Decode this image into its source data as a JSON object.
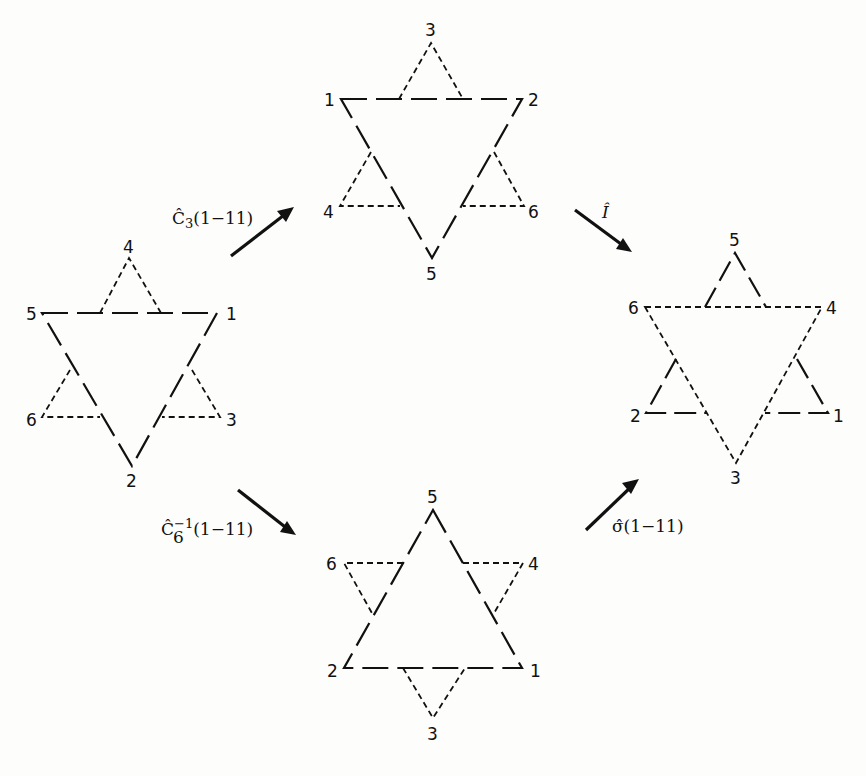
{
  "diagram": {
    "type": "symmetry-operation-equivalence",
    "stars": [
      {
        "id": "start",
        "position": "left",
        "large_triangle": {
          "style": "solid",
          "vertices": [
            "5",
            "1",
            "2"
          ]
        },
        "small_triangles": [
          {
            "style": "dashed",
            "apex": "4"
          },
          {
            "style": "dashed",
            "apex": "6"
          },
          {
            "style": "dashed",
            "apex": "3"
          }
        ],
        "labels": {
          "top": "4",
          "upper_left": "5",
          "upper_right": "1",
          "lower_left": "6",
          "lower_right": "3",
          "bottom": "2"
        }
      },
      {
        "id": "after-c3",
        "position": "top",
        "large_triangle": {
          "style": "solid",
          "vertices": [
            "1",
            "2",
            "5"
          ]
        },
        "small_triangles": [
          {
            "style": "dashed",
            "apex": "3"
          },
          {
            "style": "dashed",
            "apex": "4"
          },
          {
            "style": "dashed",
            "apex": "6"
          }
        ],
        "labels": {
          "top": "3",
          "upper_left": "1",
          "upper_right": "2",
          "lower_left": "4",
          "lower_right": "6",
          "bottom": "5"
        }
      },
      {
        "id": "after-c6inv",
        "position": "bottom",
        "large_triangle": {
          "style": "solid",
          "vertices": [
            "5",
            "2",
            "1"
          ]
        },
        "small_triangles": [
          {
            "style": "dashed",
            "apex": "6"
          },
          {
            "style": "dashed",
            "apex": "4"
          },
          {
            "style": "dashed",
            "apex": "3"
          }
        ],
        "labels": {
          "top": "5",
          "upper_left": "6",
          "upper_right": "4",
          "lower_left": "2",
          "lower_right": "1",
          "bottom": "3"
        }
      },
      {
        "id": "result",
        "position": "right",
        "large_triangle": {
          "style": "dashed",
          "vertices": [
            "6",
            "4",
            "3"
          ]
        },
        "small_triangles": [
          {
            "style": "solid",
            "apex": "5"
          },
          {
            "style": "solid",
            "apex": "2"
          },
          {
            "style": "solid",
            "apex": "1"
          }
        ],
        "labels": {
          "top": "5",
          "upper_left": "6",
          "upper_right": "4",
          "lower_left": "2",
          "lower_right": "1",
          "bottom": "3"
        }
      }
    ],
    "operations": [
      {
        "id": "c3",
        "from": "start",
        "to": "after-c3",
        "label_main": "Ĉ",
        "label_sub": "3",
        "label_sup": "",
        "label_arg": "(1−11)"
      },
      {
        "id": "inversion",
        "from": "after-c3",
        "to": "result",
        "label_main": "Î",
        "label_sub": "",
        "label_sup": "",
        "label_arg": ""
      },
      {
        "id": "c6inv",
        "from": "start",
        "to": "after-c6inv",
        "label_main": "Ĉ",
        "label_sub": "6",
        "label_sup": "−1",
        "label_arg": "(1−11)"
      },
      {
        "id": "sigma",
        "from": "after-c6inv",
        "to": "result",
        "label_main": "σ̂",
        "label_sub": "",
        "label_sup": "",
        "label_arg": "(1−11)"
      }
    ]
  },
  "labels": {
    "left": {
      "n4": "4",
      "n5": "5",
      "n1": "1",
      "n6": "6",
      "n3": "3",
      "n2": "2"
    },
    "top": {
      "n3": "3",
      "n1": "1",
      "n2": "2",
      "n4": "4",
      "n6": "6",
      "n5": "5"
    },
    "bottom": {
      "n5": "5",
      "n6": "6",
      "n4": "4",
      "n2": "2",
      "n1": "1",
      "n3": "3"
    },
    "right": {
      "n5": "5",
      "n6": "6",
      "n4": "4",
      "n2": "2",
      "n1": "1",
      "n3": "3"
    }
  },
  "ops": {
    "c3": {
      "main": "Ĉ",
      "sub": "3",
      "arg": "(1−11)"
    },
    "inv": {
      "main": "Î"
    },
    "c6": {
      "main": "Ĉ",
      "sub": "6",
      "sup": "−1",
      "arg": "(1−11)"
    },
    "sigma": {
      "main": "σ̂",
      "arg": "(1−11)"
    }
  }
}
